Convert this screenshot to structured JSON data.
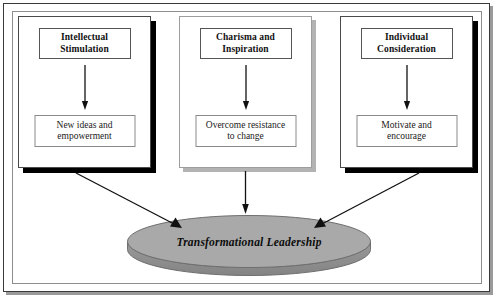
{
  "diagram": {
    "title": "Transformational Leadership",
    "frame": {
      "outer_border_color": "#3a3a3a",
      "inner_border_color": "#8d8d8d",
      "background_color": "#ffffff"
    },
    "pillars": [
      {
        "id": "intellectual-stimulation",
        "title": "Intellectual Stimulation",
        "title_line1": "Intellectual",
        "title_line2": "Stimulation",
        "outcome": "New ideas and empowerment",
        "outcome_line1": "New ideas and",
        "outcome_line2": "empowerment",
        "shadow_color": "#000000",
        "border_color": "#4a4a4a"
      },
      {
        "id": "charisma-and-inspiration",
        "title": "Charisma and Inspiration",
        "title_line1": "Charisma and",
        "title_line2": "Inspiration",
        "outcome": "Overcome resistance to change",
        "outcome_line1": "Overcome resistance",
        "outcome_line2": "to change",
        "shadow_color": "#b3b3b3",
        "border_color": "#9d9d9d"
      },
      {
        "id": "individual-consideration",
        "title": "Individual Consideration",
        "title_line1": "Individual",
        "title_line2": "Consideration",
        "outcome": "Motivate and encourage",
        "outcome_line1": "Motivate and",
        "outcome_line2": "encourage",
        "shadow_color": "#000000",
        "border_color": "#4a4a4a"
      }
    ],
    "result": {
      "label": "Transformational Leadership",
      "shape": "3d-ellipse-disc",
      "top_fill_color": "#a9a9a9",
      "side_fill_color": "#8e8e8e",
      "outline_color": "#6f6f6f"
    },
    "connectors": {
      "inner_arrow_color": "#111111",
      "converging_arrow_color": "#111111",
      "count_inner": 3,
      "count_converging": 3
    }
  }
}
